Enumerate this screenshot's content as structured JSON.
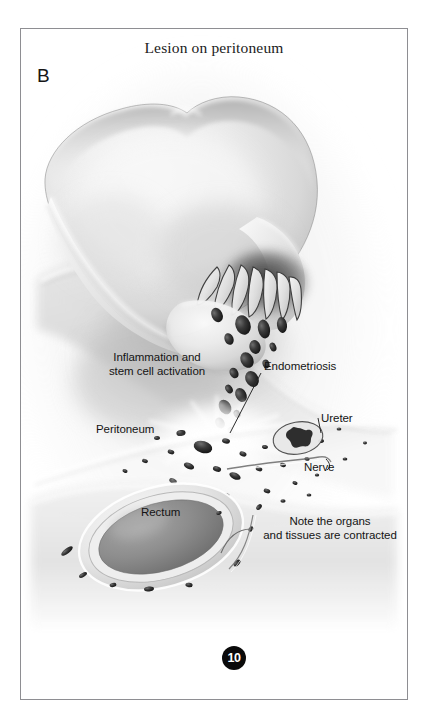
{
  "figure": {
    "title": "Lesion on peritoneum",
    "panel_letter": "B",
    "page_number": "10",
    "frame_color": "#8e8e92",
    "background_color": "#ffffff"
  },
  "annotations": {
    "inflammation_line1": "Inflammation and",
    "inflammation_line2": "stem cell activation",
    "peritoneum": "Peritoneum",
    "endometriosis": "Endometriosis",
    "ureter": "Ureter",
    "nerve": "Nerve",
    "rectum": "Rectum",
    "note_line1": "Note the organs",
    "note_line2": "and tissues are contracted"
  },
  "illustration": {
    "style": "grayscale medical airbrush illustration",
    "structures": [
      "uterus body",
      "fallopian tube with fimbriae",
      "endometrial cells shedding",
      "peritoneal surface",
      "endometriosis lesion burst",
      "ureter cross-section",
      "nerve",
      "rectum cross-section"
    ],
    "colors": {
      "tissue_light": "#f2f2f2",
      "tissue_mid": "#cfcfcf",
      "tissue_shadow": "#9a9a9a",
      "lesion_dark": "#2a2a2a",
      "rectum_lumen": "#878787",
      "leader_line": "#3a3a3a"
    }
  }
}
